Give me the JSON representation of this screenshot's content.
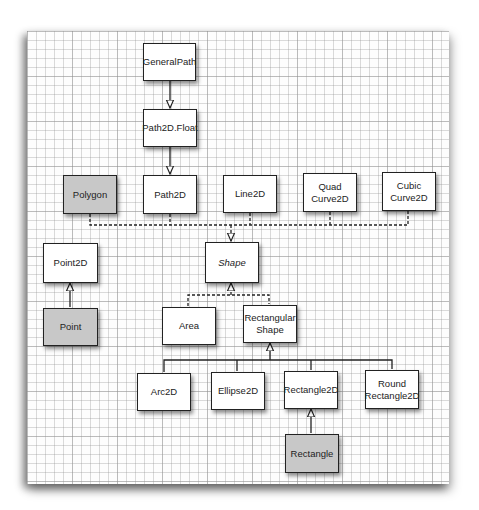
{
  "diagram": {
    "title": "",
    "colors": {
      "box_fill": "#ffffff",
      "legacy_fill": "#c8c8c8",
      "stroke": "#222222",
      "grid": "#969696"
    },
    "nodes": {
      "general_path": {
        "label": "GeneralPath",
        "style": "class"
      },
      "path2d_float": {
        "label": "Path2D.Float",
        "style": "class"
      },
      "polygon": {
        "label": "Polygon",
        "style": "legacy"
      },
      "path2d": {
        "label": "Path2D",
        "style": "class"
      },
      "line2d": {
        "label": "Line2D",
        "style": "class"
      },
      "quad_curve2d": {
        "label": "Quad\nCurve2D",
        "line1": "Quad",
        "line2": "Curve2D",
        "style": "class"
      },
      "cubic_curve2d": {
        "label": "Cubic\nCurve2D",
        "line1": "Cubic",
        "line2": "Curve2D",
        "style": "class"
      },
      "point2d": {
        "label": "Point2D",
        "style": "class"
      },
      "shape": {
        "label": "Shape",
        "style": "interface"
      },
      "point": {
        "label": "Point",
        "style": "legacy"
      },
      "area": {
        "label": "Area",
        "style": "class"
      },
      "rectangular_shape": {
        "label": "Rectangular\nShape",
        "line1": "Rectangular",
        "line2": "Shape",
        "style": "class"
      },
      "arc2d": {
        "label": "Arc2D",
        "style": "class"
      },
      "ellipse2d": {
        "label": "Ellipse2D",
        "style": "class"
      },
      "rectangle2d": {
        "label": "Rectangle2D",
        "style": "class"
      },
      "round_rectangle2d": {
        "label": "Round\nRectangle2D",
        "line1": "Round",
        "line2": "Rectangle2D",
        "style": "class"
      },
      "rectangle": {
        "label": "Rectangle",
        "style": "legacy"
      }
    },
    "edges": [
      {
        "from": "GeneralPath",
        "to": "Path2D.Float",
        "type": "extends"
      },
      {
        "from": "Path2D.Float",
        "to": "Path2D",
        "type": "extends"
      },
      {
        "from": "Polygon",
        "to": "Shape",
        "type": "implements"
      },
      {
        "from": "Path2D",
        "to": "Shape",
        "type": "implements"
      },
      {
        "from": "Line2D",
        "to": "Shape",
        "type": "implements"
      },
      {
        "from": "QuadCurve2D",
        "to": "Shape",
        "type": "implements"
      },
      {
        "from": "CubicCurve2D",
        "to": "Shape",
        "type": "implements"
      },
      {
        "from": "Point",
        "to": "Point2D",
        "type": "extends"
      },
      {
        "from": "Area",
        "to": "Shape",
        "type": "implements"
      },
      {
        "from": "RectangularShape",
        "to": "Shape",
        "type": "implements"
      },
      {
        "from": "Arc2D",
        "to": "RectangularShape",
        "type": "extends"
      },
      {
        "from": "Ellipse2D",
        "to": "RectangularShape",
        "type": "extends"
      },
      {
        "from": "Rectangle2D",
        "to": "RectangularShape",
        "type": "extends"
      },
      {
        "from": "RoundRectangle2D",
        "to": "RectangularShape",
        "type": "extends"
      },
      {
        "from": "Rectangle",
        "to": "Rectangle2D",
        "type": "extends"
      }
    ]
  }
}
